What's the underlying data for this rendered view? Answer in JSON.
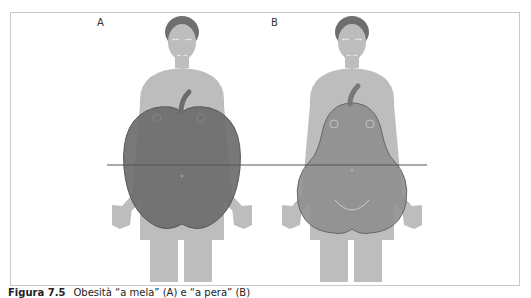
{
  "figure": {
    "panels": [
      {
        "label": "A",
        "shape": "apple"
      },
      {
        "label": "B",
        "shape": "pear"
      }
    ],
    "caption_number": "Figura 7.5",
    "caption_text": "Obesità “a mela” (A) e “a pera” (B)",
    "colors": {
      "body": "#bdbdbd",
      "skin_lines": "#e6e6e6",
      "hair": "#6f6f6f",
      "apple_fill": "#6c6c6c",
      "pear_fill": "#8e8e8e",
      "waist_line": "#555555",
      "frame": "#c8c8c8"
    }
  }
}
